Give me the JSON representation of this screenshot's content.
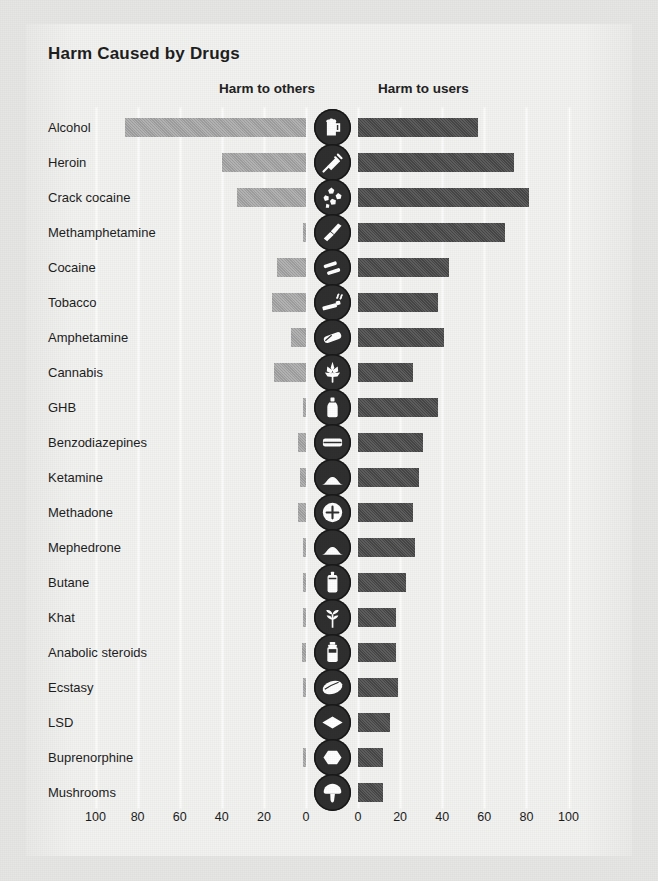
{
  "chart": {
    "title": "Harm Caused by Drugs",
    "left_header": "Harm to others",
    "right_header": "Harm to users",
    "colors": {
      "harm_to_others": "#a6a6a6",
      "harm_to_users": "#4c4c4c",
      "panel": "#f2f2f0",
      "page": "#e6e6e4",
      "icon": "#2f2f2f",
      "text": "#1d1d1d"
    },
    "axis": {
      "left_ticks": [
        "100",
        "80",
        "60",
        "40",
        "20",
        "0"
      ],
      "right_ticks": [
        "0",
        "20",
        "40",
        "60",
        "80",
        "100"
      ],
      "max": 100,
      "step": 20
    }
  },
  "chart_data": {
    "type": "bar",
    "orientation": "horizontal-diverging",
    "title": "Harm Caused by Drugs",
    "xlabel": "",
    "ylabel": "",
    "xlim": [
      0,
      100
    ],
    "grid": true,
    "legend_position": "top",
    "categories": [
      "Alcohol",
      "Heroin",
      "Crack cocaine",
      "Methamphetamine",
      "Cocaine",
      "Tobacco",
      "Amphetamine",
      "Cannabis",
      "GHB",
      "Benzodiazepines",
      "Ketamine",
      "Methadone",
      "Mephedrone",
      "Butane",
      "Khat",
      "Anabolic steroids",
      "Ecstasy",
      "LSD",
      "Buprenorphine",
      "Mushrooms"
    ],
    "series": [
      {
        "name": "Harm to others",
        "color": "#a6a6a6",
        "direction": "left",
        "values": [
          86,
          40,
          33,
          1,
          14,
          16,
          7,
          15,
          1,
          4,
          3,
          4,
          1,
          1,
          1,
          2,
          1,
          0,
          1,
          0
        ]
      },
      {
        "name": "Harm to users",
        "color": "#4c4c4c",
        "direction": "right",
        "values": [
          57,
          74,
          81,
          70,
          43,
          38,
          41,
          26,
          38,
          31,
          29,
          26,
          27,
          23,
          18,
          18,
          19,
          15,
          12,
          12
        ]
      }
    ],
    "icons": [
      "beer-mug-icon",
      "syringe-icon",
      "crack-rocks-icon",
      "meth-crystal-icon",
      "cocaine-lines-icon",
      "cigarette-icon",
      "pill-capsule-icon",
      "cannabis-leaf-icon",
      "ghb-bottle-icon",
      "tablet-icon",
      "powder-mound-icon",
      "cross-pill-icon",
      "powder-mound-icon",
      "butane-canister-icon",
      "khat-leaves-icon",
      "steroid-vial-icon",
      "ecstasy-pill-icon",
      "lsd-blotter-icon",
      "buprenorphine-tablet-icon",
      "mushroom-icon"
    ]
  }
}
